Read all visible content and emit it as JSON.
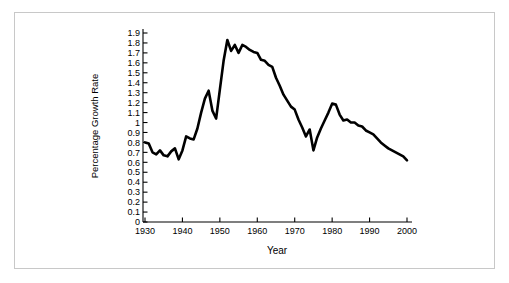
{
  "chart_data": {
    "type": "line",
    "title": "",
    "xlabel": "Year",
    "ylabel": "Percentage Growth Rate",
    "xlim": [
      1929,
      2001
    ],
    "ylim": [
      0,
      1.95
    ],
    "grid": false,
    "legend": null,
    "xticks": [
      1930,
      1940,
      1950,
      1960,
      1970,
      1980,
      1990,
      2000
    ],
    "xtick_labels": [
      "1930",
      "1940",
      "1950",
      "1960",
      "1970",
      "1980",
      "1990",
      "2000"
    ],
    "yticks": [
      0,
      0.1,
      0.2,
      0.3,
      0.4,
      0.5,
      0.6,
      0.7,
      0.8,
      0.9,
      1,
      1.1,
      1.2,
      1.3,
      1.4,
      1.5,
      1.6,
      1.7,
      1.8,
      1.9
    ],
    "ytick_labels": [
      "0",
      "0.1",
      "0.2",
      "0.3",
      "0.4",
      "0.5",
      "0.6",
      "0.7",
      "0.8",
      "0.9",
      "1",
      "1.1",
      "1.2",
      "1.3",
      "1.4",
      "1.5",
      "1.6",
      "1.7",
      "1.8",
      "1.9"
    ],
    "series": [
      {
        "name": "Percentage Growth Rate",
        "color": "#000000",
        "x": [
          1930,
          1931,
          1932,
          1933,
          1934,
          1935,
          1936,
          1937,
          1938,
          1939,
          1940,
          1941,
          1942,
          1943,
          1944,
          1945,
          1946,
          1947,
          1948,
          1949,
          1950,
          1951,
          1952,
          1953,
          1954,
          1955,
          1956,
          1957,
          1958,
          1959,
          1960,
          1961,
          1962,
          1963,
          1964,
          1965,
          1966,
          1967,
          1968,
          1969,
          1970,
          1971,
          1972,
          1973,
          1974,
          1975,
          1976,
          1977,
          1978,
          1979,
          1980,
          1981,
          1982,
          1983,
          1984,
          1985,
          1986,
          1987,
          1988,
          1989,
          1990,
          1991,
          1992,
          1993,
          1994,
          1995,
          1996,
          1997,
          1998,
          1999,
          2000
        ],
        "y": [
          0.8,
          0.79,
          0.7,
          0.68,
          0.72,
          0.67,
          0.66,
          0.71,
          0.74,
          0.63,
          0.72,
          0.86,
          0.84,
          0.83,
          0.94,
          1.1,
          1.24,
          1.32,
          1.12,
          1.04,
          1.33,
          1.62,
          1.83,
          1.72,
          1.78,
          1.7,
          1.78,
          1.76,
          1.73,
          1.71,
          1.7,
          1.63,
          1.62,
          1.58,
          1.56,
          1.45,
          1.37,
          1.28,
          1.22,
          1.16,
          1.13,
          1.03,
          0.95,
          0.86,
          0.93,
          0.72,
          0.85,
          0.94,
          1.02,
          1.1,
          1.19,
          1.18,
          1.08,
          1.02,
          1.03,
          1.0,
          1.0,
          0.97,
          0.96,
          0.92,
          0.9,
          0.88,
          0.84,
          0.8,
          0.77,
          0.74,
          0.72,
          0.7,
          0.68,
          0.66,
          0.62
        ]
      }
    ]
  },
  "frame": {
    "border_color": "#c8c8c8",
    "background": "#ffffff"
  }
}
